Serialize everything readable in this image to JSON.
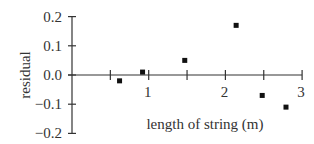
{
  "chart_data": {
    "type": "scatter",
    "title": "",
    "xlabel": "length of string (m)",
    "ylabel": "residual",
    "xlim": [
      0,
      3
    ],
    "ylim": [
      -0.2,
      0.2
    ],
    "x_ticks": [
      0.5,
      1,
      1.5,
      2,
      2.5,
      3
    ],
    "x_tick_labels": [
      "",
      "1",
      "",
      "2",
      "",
      "3"
    ],
    "y_ticks": [
      0.2,
      0.1,
      0.0,
      -0.1,
      -0.2
    ],
    "y_tick_labels": [
      "0.2",
      "0.1",
      "0.0",
      "−0.1",
      "−0.2"
    ],
    "grid": false,
    "legend": null,
    "marker": "square",
    "marker_color": "#111111",
    "series": [
      {
        "name": "residuals",
        "x": [
          0.62,
          0.92,
          1.47,
          2.14,
          2.48,
          2.79
        ],
        "y": [
          -0.02,
          0.01,
          0.05,
          0.17,
          -0.07,
          -0.11
        ]
      }
    ]
  }
}
